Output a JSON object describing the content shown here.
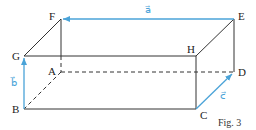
{
  "figure": {
    "caption": "Fig. 3",
    "type": "rectangular cuboid (parallelepiped) with vectors",
    "vertices": {
      "A": "A",
      "B": "B",
      "C": "C",
      "D": "D",
      "E": "E",
      "F": "F",
      "G": "G",
      "H": "H"
    },
    "vectors": {
      "a": {
        "label": "a⃗",
        "from": "E",
        "to": "F"
      },
      "b": {
        "label": "b⃗",
        "from": "B",
        "to": "G"
      },
      "c": {
        "label": "c⃗",
        "from": "C",
        "to": "D"
      }
    },
    "hidden_edges": [
      "AB",
      "AD",
      "AF"
    ],
    "colors": {
      "edge": "#333333",
      "vector": "#4aa3d8"
    }
  }
}
